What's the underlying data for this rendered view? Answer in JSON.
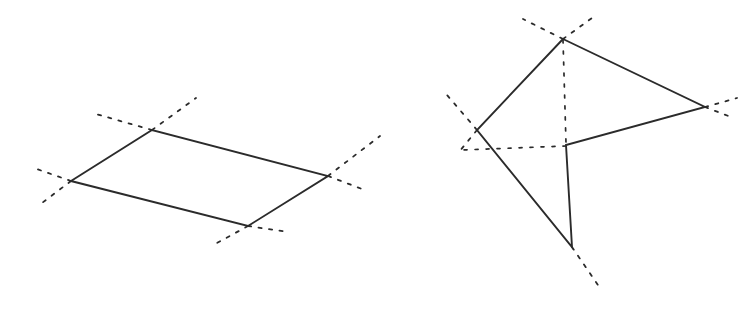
{
  "page": {
    "background_color": "#ffffff",
    "width": 749,
    "height": 311
  },
  "style": {
    "stroke_color": "#2b2b2b",
    "solid_stroke_width": 1.9,
    "dashed_stroke_width": 1.8,
    "dash_pattern": "3.2 7.4"
  },
  "figures": [
    {
      "id": "figure-left",
      "name": "parallelogram-figure",
      "shape_type": "parallelogram",
      "vertex_count": 4,
      "convex": true,
      "vertices": [
        {
          "label": "A",
          "role": "left-vertex",
          "x": 71,
          "y": 181
        },
        {
          "label": "B",
          "role": "top-vertex",
          "x": 152,
          "y": 130
        },
        {
          "label": "C",
          "role": "right-vertex",
          "x": 328,
          "y": 176
        },
        {
          "label": "D",
          "role": "bottom-vertex",
          "x": 248,
          "y": 226
        }
      ],
      "edges": [
        {
          "from": "A",
          "to": "B"
        },
        {
          "from": "B",
          "to": "C"
        },
        {
          "from": "C",
          "to": "D"
        },
        {
          "from": "D",
          "to": "A"
        }
      ],
      "path": "M 71 181 L 152 130 L 328 176 L 248 226 Z",
      "dashed_rays": [
        {
          "name": "ray-left-upper",
          "at_vertex": "A",
          "path": "M 71 181 L 31 167"
        },
        {
          "name": "ray-left-lower",
          "at_vertex": "A",
          "path": "M 71 181 L 42 203"
        },
        {
          "name": "ray-top-left",
          "at_vertex": "B",
          "path": "M 152 130 L 96 114"
        },
        {
          "name": "ray-top-upright",
          "at_vertex": "B",
          "path": "M 152 130 L 196 98"
        },
        {
          "name": "ray-right-upper",
          "at_vertex": "C",
          "path": "M 328 176 L 380 136"
        },
        {
          "name": "ray-right-lower",
          "at_vertex": "C",
          "path": "M 328 176 L 362 189"
        },
        {
          "name": "ray-bottom-left",
          "at_vertex": "D",
          "path": "M 248 226 L 217 243"
        },
        {
          "name": "ray-bottom-right",
          "at_vertex": "D",
          "path": "M 248 226 L 288 232"
        }
      ]
    },
    {
      "id": "figure-right",
      "name": "concave-dart-figure",
      "shape_type": "non-convex-pentagon",
      "vertex_count": 5,
      "convex": false,
      "vertices": [
        {
          "label": "P",
          "role": "top-vertex",
          "x": 563,
          "y": 39
        },
        {
          "label": "Q",
          "role": "right-vertex",
          "x": 705,
          "y": 107
        },
        {
          "label": "R",
          "role": "reflex-vertex",
          "x": 566,
          "y": 145
        },
        {
          "label": "S",
          "role": "bottom-vertex",
          "x": 572,
          "y": 247
        },
        {
          "label": "T",
          "role": "left-vertex",
          "x": 477,
          "y": 130
        }
      ],
      "edges": [
        {
          "from": "P",
          "to": "Q"
        },
        {
          "from": "Q",
          "to": "R"
        },
        {
          "from": "R",
          "to": "S"
        },
        {
          "from": "S",
          "to": "T"
        },
        {
          "from": "T",
          "to": "P"
        }
      ],
      "path": "M 563 39 L 705 107 L 566 145 L 572 247 L 477 130 Z",
      "dashed_rays": [
        {
          "name": "ray-top-upleft",
          "at_vertex": "P",
          "path": "M 563 39 L 523 19"
        },
        {
          "name": "ray-top-upright",
          "at_vertex": "P",
          "path": "M 563 39 L 592 18"
        },
        {
          "name": "ray-top-bisector",
          "at_vertex": "P",
          "path": "M 563 40 L 566 143"
        },
        {
          "name": "ray-right-upper",
          "at_vertex": "Q",
          "path": "M 705 107 L 737 98"
        },
        {
          "name": "ray-right-lower",
          "at_vertex": "Q",
          "path": "M 705 107 L 731 117"
        },
        {
          "name": "ray-reflex-left",
          "at_vertex": "R",
          "path": "M 566 146 L 462 150"
        },
        {
          "name": "ray-bottom-downright",
          "at_vertex": "S",
          "path": "M 572 247 L 600 288"
        },
        {
          "name": "ray-left-upleft",
          "at_vertex": "T",
          "path": "M 477 130 L 447 95"
        },
        {
          "name": "ray-left-downleft",
          "at_vertex": "T",
          "path": "M 477 130 L 459 152"
        }
      ]
    }
  ]
}
